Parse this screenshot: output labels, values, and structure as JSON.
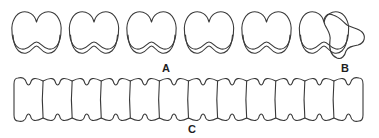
{
  "figure": {
    "stroke_color": "#3a3a3a",
    "background": "#ffffff",
    "panels": [
      {
        "id": "A",
        "label": "A",
        "description": "row of bilobed outlines with doubled lower margin",
        "count": 6,
        "label_pos": {
          "x": 162,
          "y": 63
        }
      },
      {
        "id": "B",
        "label": "B",
        "description": "single trilobed outline",
        "count": 1,
        "label_pos": {
          "x": 341,
          "y": 63
        }
      },
      {
        "id": "C",
        "label": "C",
        "description": "chain of constricted H-shaped segments",
        "count": 12,
        "label_pos": {
          "x": 188,
          "y": 124
        }
      }
    ]
  }
}
